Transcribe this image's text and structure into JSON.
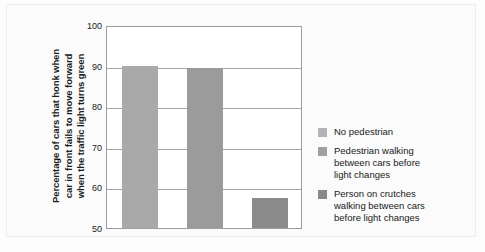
{
  "chart_data": {
    "type": "bar",
    "title": "",
    "subtitle": "",
    "xlabel": "",
    "ylabel": "Percentage of cars that honk when car in front fails to move forward when the traffic light turns green",
    "ylabel_lines": [
      "Percentage of cars that honk when",
      "car in front fails to move forward",
      "when the traffic light turns green"
    ],
    "ylim": [
      50,
      100
    ],
    "yticks": [
      50,
      60,
      70,
      80,
      90,
      100
    ],
    "ytick_labels": [
      "50",
      "60",
      "70",
      "80",
      "90",
      "100"
    ],
    "grid": "horizontal",
    "legend_position": "right",
    "categories": [
      "No pedestrian",
      "Pedestrian walking between cars before light changes",
      "Person on crutches walking between cars before light changes"
    ],
    "values": [
      90.0,
      89.3,
      57.5
    ],
    "bar_colors": [
      "#a9a9a9",
      "#9b9b9b",
      "#8b8b8b"
    ],
    "series": [
      {
        "name": "Percentage of cars that honk",
        "values": [
          90.0,
          89.3,
          57.5
        ]
      }
    ]
  },
  "legend": {
    "items": [
      {
        "label_lines": [
          "No pedestrian"
        ],
        "color": "#b4b4b4"
      },
      {
        "label_lines": [
          "Pedestrian walking",
          "between cars before",
          "light changes"
        ],
        "color": "#a0a0a0"
      },
      {
        "label_lines": [
          "Person on crutches",
          "walking between cars",
          "before light changes"
        ],
        "color": "#8a8a8a"
      }
    ]
  }
}
